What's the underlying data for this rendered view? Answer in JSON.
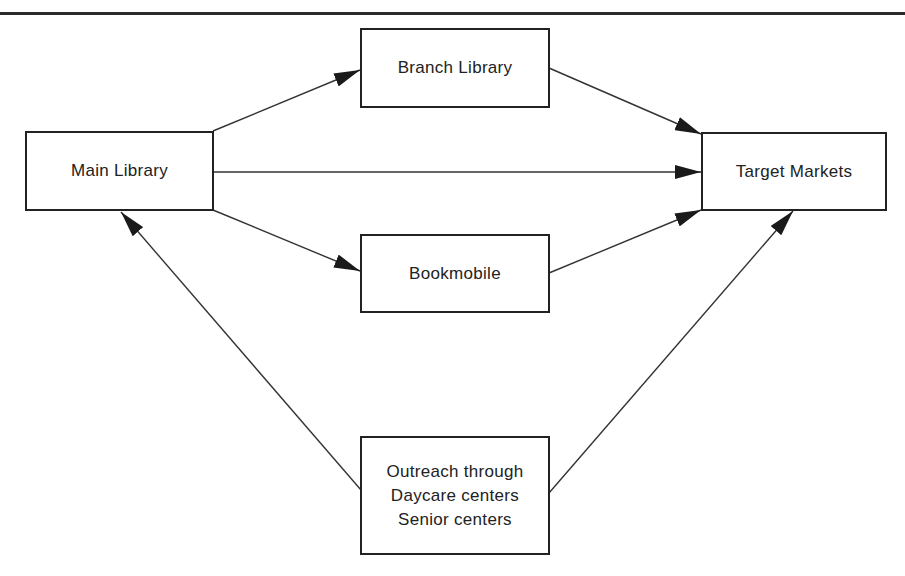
{
  "diagram": {
    "type": "flowchart",
    "nodes": {
      "main_library": {
        "label": "Main Library"
      },
      "branch_library": {
        "label": "Branch Library"
      },
      "bookmobile": {
        "label": "Bookmobile"
      },
      "target_markets": {
        "label": "Target Markets"
      },
      "outreach": {
        "lines": [
          "Outreach through",
          "Daycare centers",
          "Senior centers"
        ]
      }
    },
    "edges": [
      {
        "from": "Main Library",
        "to": "Branch Library"
      },
      {
        "from": "Main Library",
        "to": "Target Markets"
      },
      {
        "from": "Main Library",
        "to": "Bookmobile"
      },
      {
        "from": "Branch Library",
        "to": "Target Markets"
      },
      {
        "from": "Bookmobile",
        "to": "Target Markets"
      },
      {
        "from": "Outreach through Daycare centers Senior centers",
        "to": "Main Library"
      },
      {
        "from": "Outreach through Daycare centers Senior centers",
        "to": "Target Markets"
      }
    ]
  }
}
